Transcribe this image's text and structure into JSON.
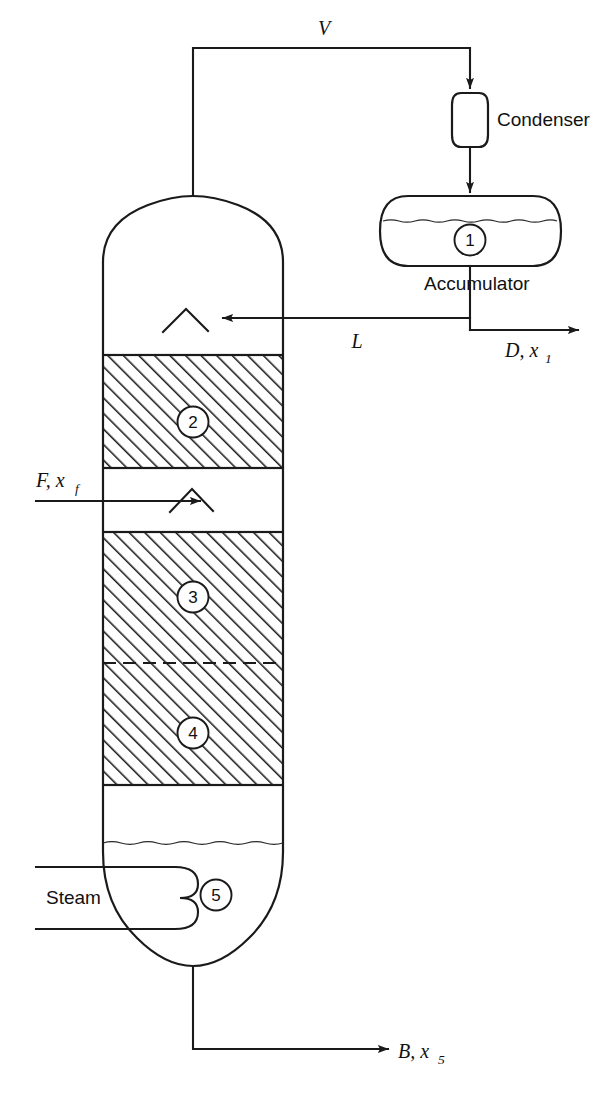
{
  "diagram": {
    "type": "process-flow-diagram",
    "background_color": "#ffffff",
    "line_color": "#1a1a1a"
  },
  "equipment": {
    "condenser": {
      "label": "Condenser",
      "shape": "vertical-capsule"
    },
    "accumulator": {
      "label": "Accumulator",
      "tag": "1",
      "shape": "horizontal-vessel-dished-ends",
      "has_liquid_level": true
    },
    "column": {
      "shape": "vertical-column-domed-ends",
      "sections": [
        {
          "tag": "2",
          "kind": "packed",
          "hatched": true
        },
        {
          "tag": "3",
          "kind": "packed",
          "hatched": true
        },
        {
          "tag": "4",
          "kind": "packed",
          "hatched": true
        }
      ],
      "sump": {
        "tag": "5",
        "has_liquid_level": true
      },
      "distributors": [
        {
          "name": "reflux-distributor"
        },
        {
          "name": "feed-distributor"
        }
      ]
    },
    "reboiler_coil": {
      "label": "Steam",
      "shape": "double-loop-coil"
    }
  },
  "streams": {
    "vapor": {
      "label": "V",
      "name": "overhead-vapor"
    },
    "reflux": {
      "label": "L",
      "name": "reflux-liquid"
    },
    "distillate": {
      "label": "D, x",
      "subscript": "1",
      "name": "distillate-product"
    },
    "feed": {
      "label": "F, x",
      "subscript": "f",
      "name": "feed-stream"
    },
    "steam": {
      "label": "Steam",
      "name": "steam-inlet"
    },
    "bottoms": {
      "label": "B, x",
      "subscript": "5",
      "name": "bottoms-product"
    }
  },
  "tags": {
    "accumulator": "1",
    "section_top": "2",
    "section_middle": "3",
    "section_lower": "4",
    "sump": "5"
  }
}
